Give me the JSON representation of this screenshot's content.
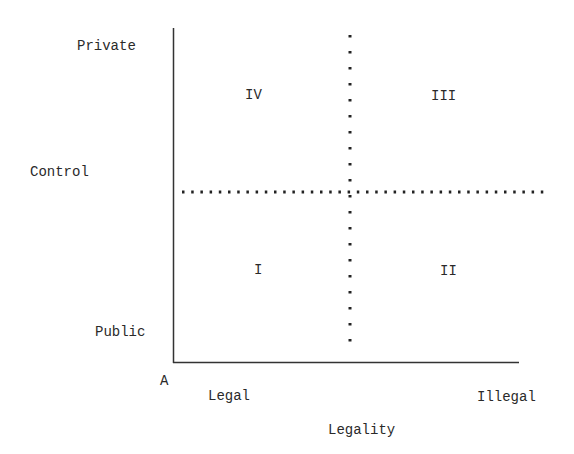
{
  "axes": {
    "y_axis_label": "Control",
    "y_top_label": "Private",
    "y_bottom_label": "Public",
    "x_axis_label": "Legality",
    "x_left_label": "Legal",
    "x_right_label": "Illegal",
    "origin_label": "A"
  },
  "quadrants": {
    "top_left": "IV",
    "top_right": "III",
    "bottom_left": "I",
    "bottom_right": "II"
  },
  "colors": {
    "line": "#333333",
    "text": "#2a2a2a"
  }
}
